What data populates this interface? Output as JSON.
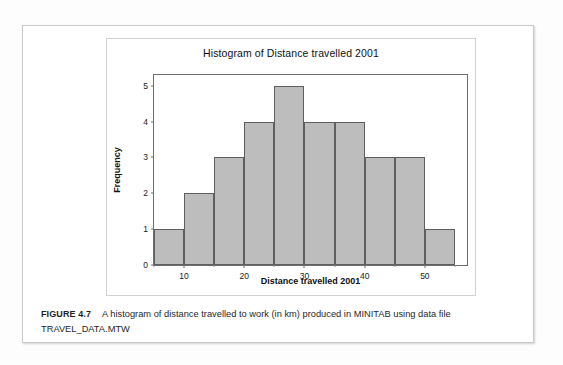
{
  "figure": {
    "caption_tag": "FIGURE 4.7",
    "caption_text": "A histogram of distance travelled to work (in km) produced in MINITAB using data file TRAVEL_DATA.MTW"
  },
  "chart_data": {
    "type": "bar",
    "title": "Histogram of Distance travelled 2001",
    "xlabel": "Distance travelled 2001",
    "ylabel": "Frequency",
    "xlim": [
      5,
      57
    ],
    "ylim": [
      0,
      5.3
    ],
    "grid": false,
    "legend": null,
    "bin_width": 5,
    "bin_edges": [
      5,
      10,
      15,
      20,
      25,
      30,
      35,
      40,
      45,
      50,
      55
    ],
    "categories": [
      "5-10",
      "10-15",
      "15-20",
      "20-25",
      "25-30",
      "30-35",
      "35-40",
      "40-45",
      "45-50",
      "50-55"
    ],
    "bin_centers": [
      7.5,
      12.5,
      17.5,
      22.5,
      27.5,
      32.5,
      37.5,
      42.5,
      47.5,
      52.5
    ],
    "values": [
      1,
      2,
      3,
      4,
      5,
      4,
      4,
      3,
      3,
      1
    ],
    "xticks": [
      10,
      20,
      30,
      40,
      50
    ],
    "xtick_labels": [
      "10",
      "20",
      "30",
      "40",
      "50"
    ],
    "xticks_minor": [
      5,
      15,
      25,
      35,
      45,
      55
    ],
    "yticks": [
      0,
      1,
      2,
      3,
      4,
      5
    ],
    "ytick_labels": [
      "0",
      "1",
      "2",
      "3",
      "4",
      "5"
    ],
    "bar_fill_color": "#bdbdbd",
    "bar_edge_color": "#5f5f5f"
  }
}
